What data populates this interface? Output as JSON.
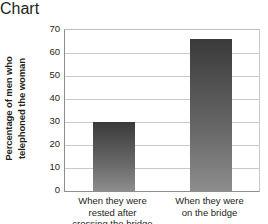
{
  "chart_data": {
    "type": "bar",
    "title": "",
    "xlabel": "",
    "ylabel": "Percentage of men who telephoned the woman",
    "categories": [
      "When they were rested after crossing the bridge",
      "When they were on the bridge"
    ],
    "values": [
      30,
      66
    ],
    "ylim": [
      0,
      70
    ],
    "ytick_step": 10,
    "yticks": [
      70,
      60,
      50,
      40,
      30,
      20,
      10,
      0
    ],
    "grid": true,
    "legend": false,
    "legend_position": "none",
    "bar_color_top": "#3a3a3a",
    "bar_color_bottom": "#8d8d8d",
    "gridline_color": "#c9c9c9",
    "axis_color": "#8e8e8e",
    "background": "#ffffff"
  },
  "axes": {
    "y_title_lines": [
      "Percentage of men who",
      "telephoned the woman"
    ],
    "x_category_lines": [
      [
        "When they were",
        "rested after",
        "crossing the bridge"
      ],
      [
        "When they were",
        "on the bridge"
      ]
    ]
  }
}
